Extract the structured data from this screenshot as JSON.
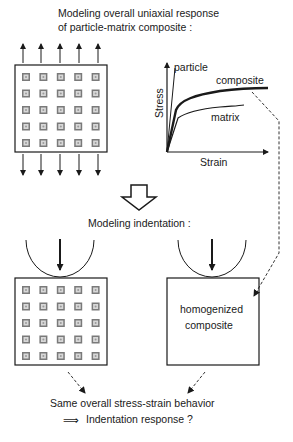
{
  "title": {
    "line1": "Modeling overall uniaxial response",
    "line2": "of particle-matrix composite :"
  },
  "uniaxial_model": {
    "grid_rows": 5,
    "grid_cols": 5,
    "load_arrows_top": 5,
    "load_arrows_bottom": 5
  },
  "stress_strain_plot": {
    "x_axis_label": "Strain",
    "y_axis_label": "Stress",
    "curves": [
      {
        "name": "particle",
        "label": "particle",
        "style": "thin"
      },
      {
        "name": "composite",
        "label": "composite",
        "style": "thick"
      },
      {
        "name": "matrix",
        "label": "matrix",
        "style": "thin"
      }
    ]
  },
  "transition_arrow": "hollow-down-arrow-icon",
  "indentation_heading": "Modeling indentation :",
  "indentation_left": {
    "grid_rows": 5,
    "grid_cols": 5
  },
  "indentation_right": {
    "label_line1": "homogenized",
    "label_line2": "composite"
  },
  "conclusion": {
    "line1": "Same overall stress-strain behavior",
    "implies_symbol": "⟹",
    "line2": "Indentation response ?"
  }
}
